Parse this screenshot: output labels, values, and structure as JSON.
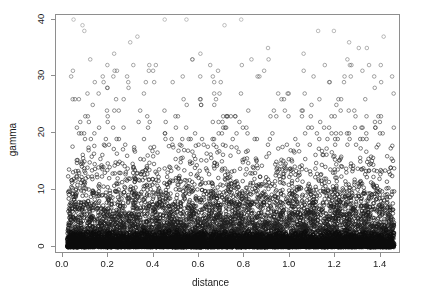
{
  "figure": {
    "kind": "scatterplot",
    "background_color": "#ffffff",
    "frame_color": "#8e8e8e",
    "point_color": "#111111",
    "point_symbol": "open-circle"
  },
  "chart_data": {
    "type": "scatter",
    "title": "",
    "xlabel": "distance",
    "ylabel": "gamma",
    "xlim": [
      -0.03,
      1.49
    ],
    "ylim": [
      -1.2,
      40.8
    ],
    "xticks": [
      0.0,
      0.2,
      0.4,
      0.6,
      0.8,
      1.0,
      1.2,
      1.4
    ],
    "xticklabels": [
      "0.0",
      "0.2",
      "0.4",
      "0.6",
      "0.8",
      "1.0",
      "1.2",
      "1.4"
    ],
    "yticks": [
      0,
      10,
      20,
      30,
      40
    ],
    "yticklabels": [
      "0",
      "10",
      "20",
      "30",
      "40"
    ],
    "grid": false,
    "legend": null,
    "marker": "open-circle",
    "marker_size": 3.6,
    "n_points": 5200,
    "x_range_observed": [
      0.02,
      1.46
    ],
    "y_range_observed": [
      0,
      40
    ],
    "y_density_profile": [
      {
        "gamma_band": [
          0,
          2
        ],
        "relative_density": 1.0
      },
      {
        "gamma_band": [
          2,
          4
        ],
        "relative_density": 0.82
      },
      {
        "gamma_band": [
          4,
          6
        ],
        "relative_density": 0.58
      },
      {
        "gamma_band": [
          6,
          8
        ],
        "relative_density": 0.4
      },
      {
        "gamma_band": [
          8,
          10
        ],
        "relative_density": 0.27
      },
      {
        "gamma_band": [
          10,
          12
        ],
        "relative_density": 0.18
      },
      {
        "gamma_band": [
          12,
          14
        ],
        "relative_density": 0.12
      },
      {
        "gamma_band": [
          14,
          16
        ],
        "relative_density": 0.08
      },
      {
        "gamma_band": [
          16,
          18
        ],
        "relative_density": 0.055
      },
      {
        "gamma_band": [
          18,
          20
        ],
        "relative_density": 0.038
      },
      {
        "gamma_band": [
          20,
          24
        ],
        "relative_density": 0.024
      },
      {
        "gamma_band": [
          24,
          28
        ],
        "relative_density": 0.014
      },
      {
        "gamma_band": [
          28,
          32
        ],
        "relative_density": 0.011
      },
      {
        "gamma_band": [
          32,
          36
        ],
        "relative_density": 0.006
      },
      {
        "gamma_band": [
          36,
          40
        ],
        "relative_density": 0.005
      }
    ],
    "integer_bands_visible_above": 18
  }
}
